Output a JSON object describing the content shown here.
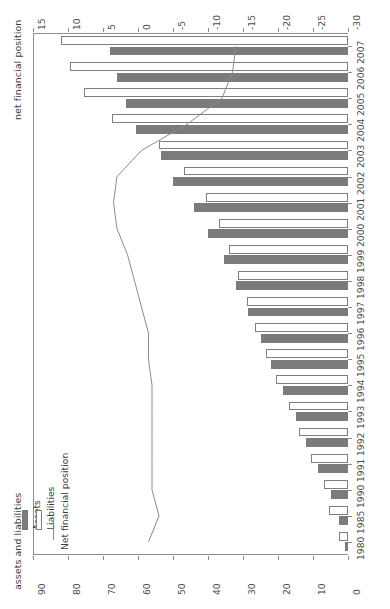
{
  "chart_data": {
    "type": "bar",
    "orientation": "horizontal-rotated",
    "title": "",
    "top_axis_label": "net financial position",
    "bottom_axis_label": "assets and liabilities",
    "categories": [
      "1980",
      "1985",
      "1990",
      "1991",
      "1992",
      "1993",
      "1994",
      "1995",
      "1996",
      "1997",
      "1998",
      "1999",
      "2000",
      "2001",
      "2002",
      "2003",
      "2004",
      "2005",
      "2006",
      "2007"
    ],
    "series": [
      {
        "name": "Assets",
        "type": "bar",
        "color": "#7b7b7b",
        "values": [
          1.0,
          2.5,
          5.0,
          8.5,
          12.0,
          15.0,
          18.5,
          22.0,
          25.0,
          28.5,
          32.0,
          35.5,
          40.0,
          44.0,
          50.0,
          53.5,
          60.5,
          63.5,
          66.0,
          68.0
        ]
      },
      {
        "name": "Liabilities",
        "type": "bar",
        "color": "#ffffff",
        "values": [
          2.5,
          5.5,
          7.0,
          10.5,
          14.0,
          17.0,
          20.5,
          23.5,
          26.5,
          29.0,
          31.5,
          34.0,
          37.0,
          40.5,
          47.0,
          54.0,
          67.5,
          75.5,
          79.5,
          82.0
        ]
      },
      {
        "name": "Net financial position",
        "type": "line",
        "color": "#8c8c8c",
        "values": [
          -1.5,
          -3.0,
          -2.0,
          -2.0,
          -2.0,
          -2.0,
          -2.0,
          -1.5,
          -1.5,
          -0.5,
          0.5,
          1.5,
          3.0,
          3.5,
          3.0,
          -0.5,
          -7.0,
          -12.0,
          -13.5,
          -14.0
        ]
      }
    ],
    "top_axis": {
      "ticks": [
        "15",
        "10",
        "5",
        "0",
        "-5",
        "-10",
        "-15",
        "-20",
        "-25",
        "-30"
      ],
      "min": 15,
      "max": -30,
      "direction": "decreasing-left-to-right"
    },
    "bottom_axis": {
      "ticks": [
        "90",
        "80",
        "70",
        "60",
        "50",
        "40",
        "30",
        "20",
        "10",
        "0"
      ],
      "min": 90,
      "max": 0,
      "direction": "decreasing-left-to-right"
    },
    "grid": false,
    "legend_position": "bottom-left"
  },
  "legend": {
    "items": [
      {
        "label": "Assets",
        "swatch": "assets-swatch"
      },
      {
        "label": "Liabilities",
        "swatch": "liabilities-swatch"
      },
      {
        "label": "Net financial position",
        "swatch": "net-financial-position-line"
      }
    ]
  },
  "axes": {
    "top_title": "net financial position",
    "bottom_title": "assets and liabilities",
    "top_ticks": [
      "15",
      "10",
      "5",
      "0",
      "-5",
      "-10",
      "-15",
      "-20",
      "-25",
      "-30"
    ],
    "bottom_ticks": [
      "90",
      "80",
      "70",
      "60",
      "50",
      "40",
      "30",
      "20",
      "10",
      "0"
    ],
    "years": [
      "1980",
      "1985",
      "1990",
      "1991",
      "1992",
      "1993",
      "1994",
      "1995",
      "1996",
      "1997",
      "1998",
      "1999",
      "2000",
      "2001",
      "2002",
      "2003",
      "2004",
      "2005",
      "2006",
      "2007"
    ]
  }
}
